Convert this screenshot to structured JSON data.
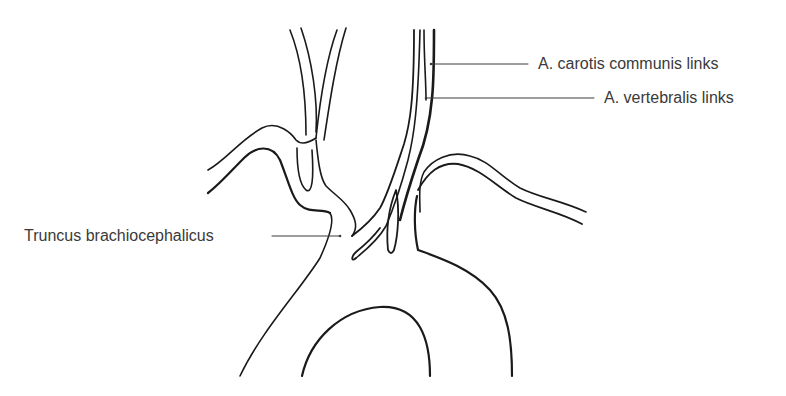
{
  "diagram": {
    "colors": {
      "stroke": "#1a1a1a",
      "label_text": "#3a3a3a",
      "background": "#ffffff"
    },
    "labels": [
      {
        "id": "carotis",
        "text": "A. carotis communis links"
      },
      {
        "id": "vertebralis",
        "text": "A. vertebralis links"
      },
      {
        "id": "truncus",
        "text": "Truncus brachiocephalicus"
      }
    ]
  }
}
